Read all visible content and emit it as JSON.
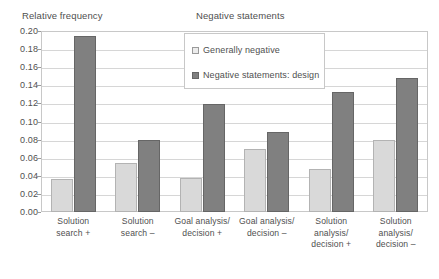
{
  "chart_data": {
    "type": "bar",
    "title": "Negative statements",
    "xlabel": "",
    "ylabel": "Relative frequency",
    "ylim": [
      0.0,
      0.2
    ],
    "ytick_labels": [
      "0.20",
      "0.18",
      "0.16",
      "0.14",
      "0.12",
      "0.10",
      "0.08",
      "0.06",
      "0.04",
      "0.02",
      "0.00"
    ],
    "ytick_values": [
      0.2,
      0.18,
      0.16,
      0.14,
      0.12,
      0.1,
      0.08,
      0.06,
      0.04,
      0.02,
      0.0
    ],
    "grid": true,
    "legend_position": "upper-center",
    "categories": [
      "Solution search +",
      "Solution search –",
      "Goal analysis/ decision +",
      "Goal analysis/ decision –",
      "Solution analysis/ decision +",
      "Solution analysis/ decision –"
    ],
    "category_lines": [
      [
        "Solution",
        "search +"
      ],
      [
        "Solution",
        "search –"
      ],
      [
        "Goal analysis/",
        "decision +"
      ],
      [
        "Goal analysis/",
        "decision –"
      ],
      [
        "Solution",
        "analysis/",
        "decision +"
      ],
      [
        "Solution",
        "analysis/",
        "decision –"
      ]
    ],
    "series": [
      {
        "name": "Generally negative",
        "color": "#d9d9d9",
        "values": [
          0.037,
          0.054,
          0.038,
          0.07,
          0.047,
          0.08
        ]
      },
      {
        "name": "Negative statements: design",
        "color": "#808080",
        "values": [
          0.195,
          0.08,
          0.119,
          0.088,
          0.133,
          0.148
        ]
      }
    ]
  },
  "legend": {
    "items": [
      {
        "label": "Generally negative"
      },
      {
        "label": "Negative statements: design"
      }
    ]
  },
  "colors": {
    "series_light": "#d9d9d9",
    "series_dark": "#808080",
    "grid": "#d6d6d6",
    "frame": "#c8c8c8",
    "text": "#4f4f4f"
  }
}
